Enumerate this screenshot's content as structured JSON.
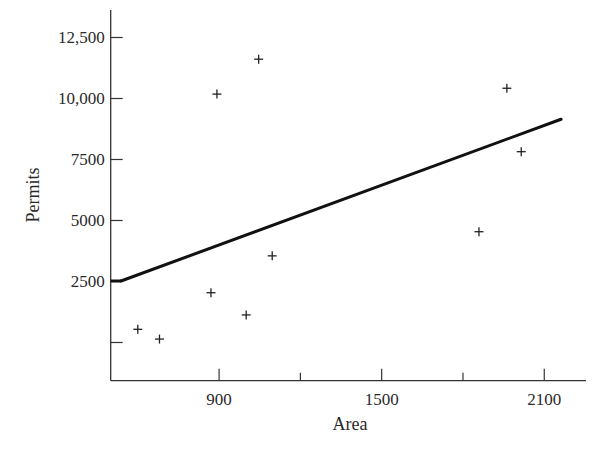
{
  "chart_data": {
    "type": "scatter",
    "title": "",
    "xlabel": "Area",
    "ylabel": "Permits",
    "xlim": [
      500,
      2254
    ],
    "ylim": [
      -1566,
      13627
    ],
    "grid": false,
    "legend": null,
    "x_ticks": [
      {
        "value": 900,
        "label": "900"
      },
      {
        "value": 1200,
        "label": ""
      },
      {
        "value": 1500,
        "label": "1500"
      },
      {
        "value": 1800,
        "label": ""
      },
      {
        "value": 2100,
        "label": "2100"
      }
    ],
    "y_ticks": [
      {
        "value": 0,
        "label": ""
      },
      {
        "value": 2500,
        "label": "2500"
      },
      {
        "value": 5000,
        "label": "5000"
      },
      {
        "value": 7500,
        "label": "7500"
      },
      {
        "value": 10000,
        "label": "10,000"
      },
      {
        "value": 12500,
        "label": "12,500"
      }
    ],
    "series": [
      {
        "name": "observations",
        "marker": "+",
        "points": [
          {
            "x": 600,
            "y": 540
          },
          {
            "x": 680,
            "y": 140
          },
          {
            "x": 870,
            "y": 2040
          },
          {
            "x": 892,
            "y": 10180
          },
          {
            "x": 1000,
            "y": 1130
          },
          {
            "x": 1046,
            "y": 11610
          },
          {
            "x": 1096,
            "y": 3550
          },
          {
            "x": 1859,
            "y": 4540
          },
          {
            "x": 1962,
            "y": 10420
          },
          {
            "x": 2015,
            "y": 7820
          }
        ]
      },
      {
        "name": "regression line",
        "type": "line",
        "points": [
          {
            "x": 538,
            "y": 2520
          },
          {
            "x": 2162,
            "y": 9150
          }
        ]
      }
    ]
  }
}
